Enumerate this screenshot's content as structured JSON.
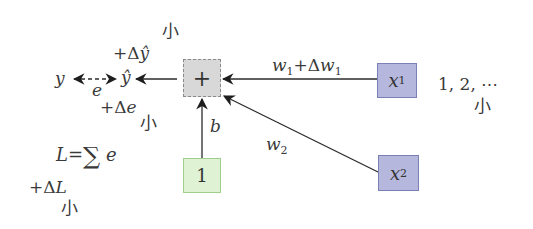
{
  "diagram": {
    "nodes": {
      "sum": {
        "label": "+"
      },
      "x1": {
        "var": "x",
        "sub": "1"
      },
      "x2": {
        "var": "x",
        "sub": "2"
      },
      "bias": {
        "label": "1"
      }
    },
    "edges": {
      "w1": {
        "w": "w",
        "sub": "1",
        "plus": "+Δ",
        "w2": "w",
        "sub2": "1"
      },
      "w2": {
        "w": "w",
        "sub": "2"
      },
      "b": {
        "label": "b"
      },
      "e": {
        "label": "e"
      }
    },
    "labels": {
      "y": "y",
      "y_hat": "ŷ",
      "delta_y_hat_prefix": "+Δ",
      "delta_y_hat_var": "ŷ",
      "small_1": "小",
      "delta_e_prefix": "+Δ",
      "delta_e_var": "e",
      "small_2": "小",
      "loss_lhs": "L",
      "loss_eq": "=",
      "loss_sum": "∑",
      "loss_rhs": "e",
      "delta_L_prefix": "+Δ",
      "delta_L_var": "L",
      "small_3": "小",
      "sequence": "1, 2, ⋯",
      "small_4": "小"
    },
    "colors": {
      "sum_fill": "#d8d8d8",
      "input_fill": "#b5b8dc",
      "bias_fill": "#dff2d3",
      "line": "#2b2b2b"
    }
  }
}
